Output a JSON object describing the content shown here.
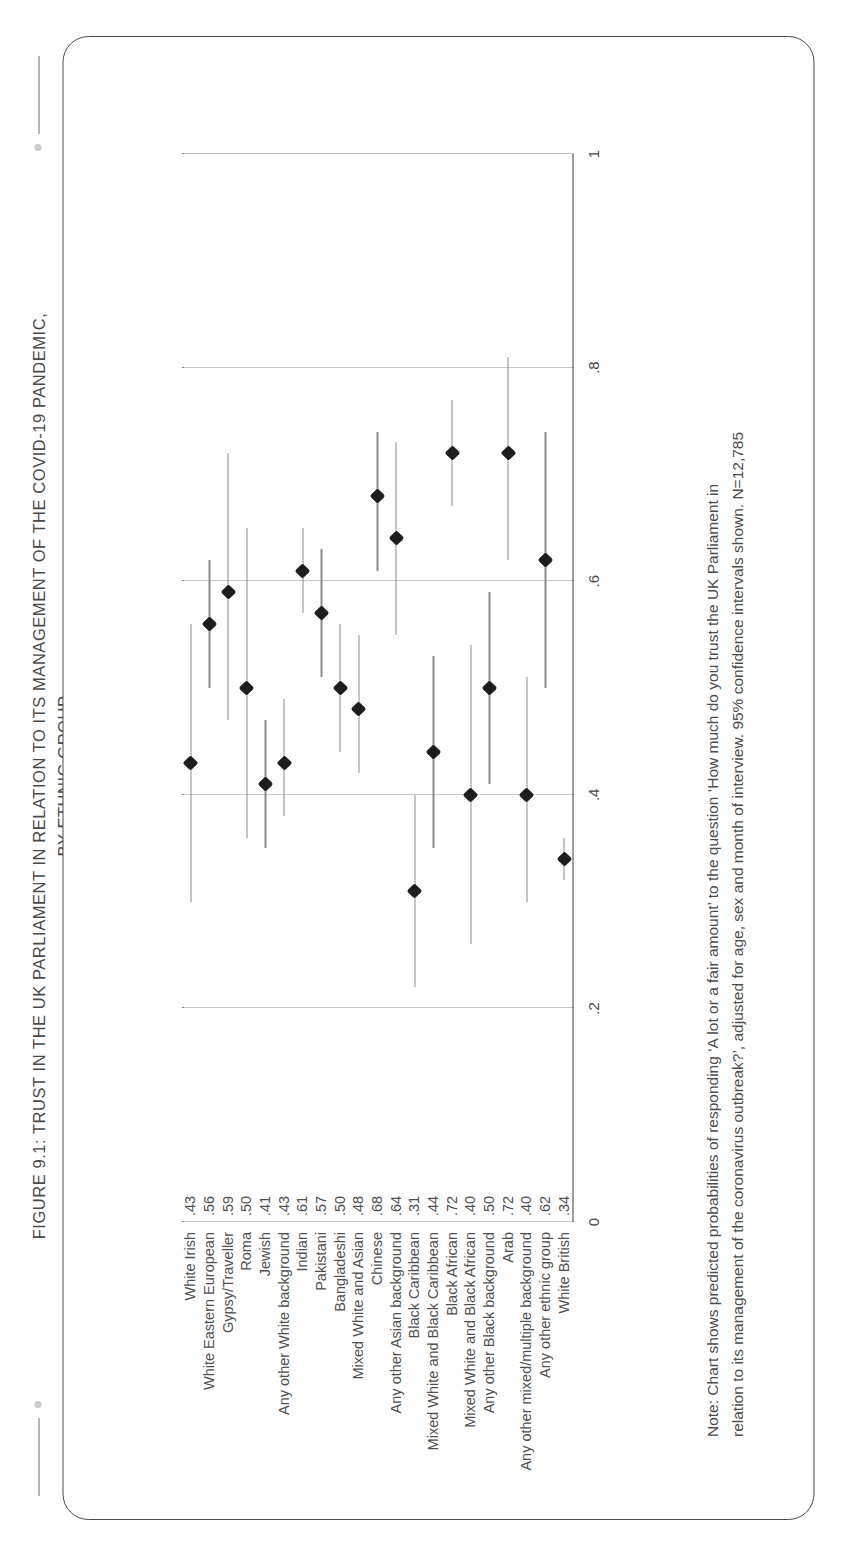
{
  "figure": {
    "title_line1": "FIGURE 9.1: TRUST IN THE UK PARLIAMENT IN RELATION TO ITS MANAGEMENT OF THE COVID-19 PANDEMIC,",
    "title_line2": "BY ETHNIC GROUP",
    "note_line1": "Note: Chart shows predicted probabilities of responding ‘A lot or a fair amount’ to the question ‘How much do you trust the UK Parliament in",
    "note_line2": "relation to its management of the coronavirus outbreak?’, adjusted for age, sex and month of interview. 95% confidence intervals shown. N=12,785"
  },
  "colors": {
    "marker": "#1d1d1d",
    "ci_line": "#8b8b8b",
    "gridline": "#8e8e8e",
    "axis": "#3a3a3a",
    "text": "#4a4a4a",
    "card_border": "#4d4d4d"
  },
  "chart_data": {
    "type": "scatter",
    "title": "FIGURE 9.1: TRUST IN THE UK PARLIAMENT IN RELATION TO ITS MANAGEMENT OF THE COVID-19 PANDEMIC, BY ETHNIC GROUP",
    "xlabel": "",
    "ylabel": "",
    "orientation": "horizontal",
    "grid": true,
    "legend": "none",
    "xlim": [
      0,
      1
    ],
    "xticks": [
      0,
      0.2,
      0.4,
      0.6,
      0.8,
      1
    ],
    "xtick_labels": [
      "0",
      ".2",
      ".4",
      ".6",
      ".8",
      "1"
    ],
    "categories": [
      "White Irish",
      "White Eastern European",
      "Gypsy/Traveller",
      "Roma",
      "Jewish",
      "Any other White background",
      "Indian",
      "Pakistani",
      "Bangladeshi",
      "Mixed White and Asian",
      "Chinese",
      "Any other Asian background",
      "Black Caribbean",
      "Mixed White and Black Caribbean",
      "Black African",
      "Mixed White and Black African",
      "Any other Black background",
      "Arab",
      "Any other mixed/multiple background",
      "Any other ethnic group",
      "White British"
    ],
    "value_labels": [
      ".43",
      ".56",
      ".59",
      ".50",
      ".41",
      ".43",
      ".61",
      ".57",
      ".50",
      ".48",
      ".68",
      ".64",
      ".31",
      ".44",
      ".72",
      ".40",
      ".50",
      ".72",
      ".40",
      ".62",
      ".34"
    ],
    "values": [
      0.43,
      0.56,
      0.59,
      0.5,
      0.41,
      0.43,
      0.61,
      0.57,
      0.5,
      0.48,
      0.68,
      0.64,
      0.31,
      0.44,
      0.72,
      0.4,
      0.5,
      0.72,
      0.4,
      0.62,
      0.34
    ],
    "ci_lower": [
      0.3,
      0.5,
      0.47,
      0.36,
      0.35,
      0.38,
      0.57,
      0.51,
      0.44,
      0.42,
      0.61,
      0.55,
      0.22,
      0.35,
      0.67,
      0.26,
      0.41,
      0.62,
      0.3,
      0.5,
      0.32
    ],
    "ci_upper": [
      0.56,
      0.62,
      0.72,
      0.65,
      0.47,
      0.49,
      0.65,
      0.63,
      0.56,
      0.55,
      0.74,
      0.73,
      0.4,
      0.53,
      0.77,
      0.54,
      0.59,
      0.81,
      0.51,
      0.74,
      0.36
    ]
  }
}
